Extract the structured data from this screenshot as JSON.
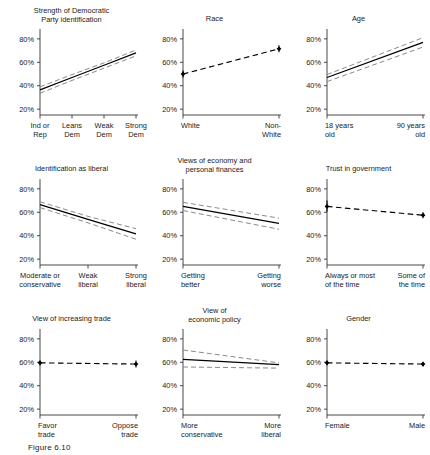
{
  "figure": {
    "caption": "Figure 6.10",
    "y_ticks": [
      "20%",
      "40%",
      "60%",
      "80%"
    ],
    "ylim": [
      15,
      85
    ],
    "grid": false,
    "legend": "none",
    "line_color": "#000000",
    "ci_color": "#8a8a8a"
  },
  "chart_data": [
    {
      "type": "line",
      "title": "Strength of Democratic\nParty identification",
      "title_lines": [
        "Strength of Democratic",
        "Party identification"
      ],
      "xlabel": "",
      "ylabel": "",
      "ylim": [
        15,
        85
      ],
      "ytick_labels": [
        "20%",
        "40%",
        "60%",
        "80%"
      ],
      "ytick_values": [
        20,
        40,
        60,
        80
      ],
      "categories": [
        "Ind or Rep",
        "Leans Dem",
        "Weak Dem",
        "Strong Dem"
      ],
      "category_lines": [
        [
          "Ind or",
          "Rep"
        ],
        [
          "Leans",
          "Dem"
        ],
        [
          "Weak",
          "Dem"
        ],
        [
          "Strong",
          "Dem"
        ]
      ],
      "x": [
        0,
        1,
        2,
        3
      ],
      "series": [
        {
          "name": "estimate",
          "style": "solid",
          "values": [
            36.5,
            47.0,
            57.5,
            68.0
          ]
        },
        {
          "name": "ci_upper",
          "style": "dashed",
          "values": [
            39.0,
            49.5,
            59.5,
            70.5
          ]
        },
        {
          "name": "ci_lower",
          "style": "dashed",
          "values": [
            33.5,
            44.5,
            55.0,
            65.5
          ]
        }
      ]
    },
    {
      "type": "scatter",
      "title": "Race",
      "title_lines": [
        "Race"
      ],
      "xlabel": "",
      "ylabel": "",
      "ylim": [
        15,
        85
      ],
      "ytick_labels": [
        "20%",
        "40%",
        "60%",
        "80%"
      ],
      "ytick_values": [
        20,
        40,
        60,
        80
      ],
      "categories": [
        "White",
        "Non-White"
      ],
      "category_lines": [
        [
          "White"
        ],
        [
          "Non-",
          "White"
        ]
      ],
      "x": [
        0,
        1
      ],
      "series": [
        {
          "name": "estimate",
          "style": "dashed-with-points",
          "values": [
            50.0,
            71.5
          ],
          "ci_upper": [
            53.0,
            74.5
          ],
          "ci_lower": [
            47.0,
            68.5
          ]
        }
      ]
    },
    {
      "type": "line",
      "title": "Age",
      "title_lines": [
        "Age"
      ],
      "xlabel": "",
      "ylabel": "",
      "ylim": [
        15,
        85
      ],
      "ytick_labels": [
        "20%",
        "40%",
        "60%",
        "80%"
      ],
      "ytick_values": [
        20,
        40,
        60,
        80
      ],
      "categories": [
        "18 years old",
        "90 years old"
      ],
      "category_lines": [
        [
          "18 years",
          "old"
        ],
        [
          "90 years",
          "old"
        ]
      ],
      "x": [
        0,
        1
      ],
      "series": [
        {
          "name": "estimate",
          "style": "solid",
          "values": [
            47.0,
            77.0
          ]
        },
        {
          "name": "ci_upper",
          "style": "dashed",
          "values": [
            49.5,
            81.0
          ]
        },
        {
          "name": "ci_lower",
          "style": "dashed",
          "values": [
            43.5,
            73.0
          ]
        }
      ]
    },
    {
      "type": "line",
      "title": "Identification as liberal",
      "title_lines": [
        "Identification as liberal"
      ],
      "xlabel": "",
      "ylabel": "",
      "ylim": [
        15,
        85
      ],
      "ytick_labels": [
        "20%",
        "40%",
        "60%",
        "80%"
      ],
      "ytick_values": [
        20,
        40,
        60,
        80
      ],
      "categories": [
        "Moderate or conservative",
        "Weak liberal",
        "Strong liberal"
      ],
      "category_lines": [
        [
          "Moderate or",
          "conservative"
        ],
        [
          "Weak",
          "liberal"
        ],
        [
          "Strong",
          "liberal"
        ]
      ],
      "x": [
        0,
        1,
        2
      ],
      "series": [
        {
          "name": "estimate",
          "style": "solid",
          "values": [
            66.5,
            54.0,
            41.5
          ]
        },
        {
          "name": "ci_upper",
          "style": "dashed",
          "values": [
            69.0,
            56.5,
            46.0
          ]
        },
        {
          "name": "ci_lower",
          "style": "dashed",
          "values": [
            64.0,
            51.0,
            37.0
          ]
        }
      ]
    },
    {
      "type": "line",
      "title": "Views of economy and\npersonal finances",
      "title_lines": [
        "Views of economy and",
        "personal finances"
      ],
      "xlabel": "",
      "ylabel": "",
      "ylim": [
        15,
        85
      ],
      "ytick_labels": [
        "20%",
        "40%",
        "60%",
        "80%"
      ],
      "ytick_values": [
        20,
        40,
        60,
        80
      ],
      "categories": [
        "Getting better",
        "Getting worse"
      ],
      "category_lines": [
        [
          "Getting",
          "better"
        ],
        [
          "Getting",
          "worse"
        ]
      ],
      "x": [
        0,
        1
      ],
      "series": [
        {
          "name": "estimate",
          "style": "solid",
          "values": [
            65.0,
            50.5
          ]
        },
        {
          "name": "ci_upper",
          "style": "dashed",
          "values": [
            68.5,
            55.0
          ]
        },
        {
          "name": "ci_lower",
          "style": "dashed",
          "values": [
            61.5,
            45.5
          ]
        }
      ]
    },
    {
      "type": "scatter",
      "title": "Trust in government",
      "title_lines": [
        "Trust in government"
      ],
      "xlabel": "",
      "ylabel": "",
      "ylim": [
        15,
        85
      ],
      "ytick_labels": [
        "20%",
        "40%",
        "60%",
        "80%"
      ],
      "ytick_values": [
        20,
        40,
        60,
        80
      ],
      "categories": [
        "Always or most of the time",
        "Some of the time"
      ],
      "category_lines": [
        [
          "Always or most",
          "of the time"
        ],
        [
          "Some of",
          "the time"
        ]
      ],
      "x": [
        0,
        1
      ],
      "series": [
        {
          "name": "estimate",
          "style": "dashed-with-points",
          "values": [
            65.0,
            57.5
          ],
          "ci_upper": [
            70.0,
            60.0
          ],
          "ci_lower": [
            60.5,
            55.0
          ]
        }
      ]
    },
    {
      "type": "scatter",
      "title": "View of increasing trade",
      "title_lines": [
        "View of increasing trade"
      ],
      "xlabel": "",
      "ylabel": "",
      "ylim": [
        15,
        85
      ],
      "ytick_labels": [
        "20%",
        "40%",
        "60%",
        "80%"
      ],
      "ytick_values": [
        20,
        40,
        60,
        80
      ],
      "categories": [
        "Favor trade",
        "Oppose trade"
      ],
      "category_lines": [
        [
          "Favor",
          "trade"
        ],
        [
          "Oppose",
          "trade"
        ]
      ],
      "x": [
        0,
        1
      ],
      "series": [
        {
          "name": "estimate",
          "style": "dashed-with-points",
          "values": [
            59.5,
            58.5
          ],
          "ci_upper": [
            61.5,
            61.5
          ],
          "ci_lower": [
            57.5,
            55.5
          ]
        }
      ]
    },
    {
      "type": "line",
      "title": "View of\neconomic policy",
      "title_lines": [
        "View of",
        "economic policy"
      ],
      "xlabel": "",
      "ylabel": "",
      "ylim": [
        15,
        85
      ],
      "ytick_labels": [
        "20%",
        "40%",
        "60%",
        "80%"
      ],
      "ytick_values": [
        20,
        40,
        60,
        80
      ],
      "categories": [
        "More conservative",
        "More liberal"
      ],
      "category_lines": [
        [
          "More",
          "conservative"
        ],
        [
          "More",
          "liberal"
        ]
      ],
      "x": [
        0,
        1
      ],
      "series": [
        {
          "name": "estimate",
          "style": "solid",
          "values": [
            62.5,
            58.0
          ]
        },
        {
          "name": "ci_upper",
          "style": "dashed",
          "values": [
            70.5,
            59.5
          ]
        },
        {
          "name": "ci_lower",
          "style": "dashed",
          "values": [
            56.0,
            55.0
          ]
        }
      ]
    },
    {
      "type": "scatter",
      "title": "Gender",
      "title_lines": [
        "Gender"
      ],
      "xlabel": "",
      "ylabel": "",
      "ylim": [
        15,
        85
      ],
      "ytick_labels": [
        "20%",
        "40%",
        "60%",
        "80%"
      ],
      "ytick_values": [
        20,
        40,
        60,
        80
      ],
      "categories": [
        "Female",
        "Male"
      ],
      "category_lines": [
        [
          "Female"
        ],
        [
          "Male"
        ]
      ],
      "x": [
        0,
        1
      ],
      "series": [
        {
          "name": "estimate",
          "style": "dashed-with-points",
          "values": [
            59.5,
            58.5
          ],
          "ci_upper": [
            61.5,
            60.5
          ],
          "ci_lower": [
            57.5,
            56.5
          ]
        }
      ]
    }
  ]
}
